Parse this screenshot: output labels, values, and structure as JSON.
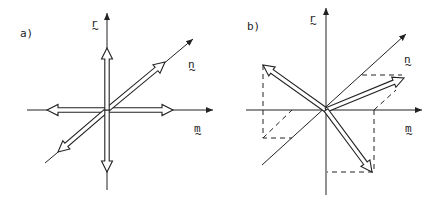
{
  "panels": [
    {
      "id": "a",
      "label": "a)",
      "axis_labels": {
        "r": "r",
        "n": "n",
        "m": "m"
      },
      "description": "Three double-headed vector pairs along r, n and m axes"
    },
    {
      "id": "b",
      "label": "b)",
      "axis_labels": {
        "r": "r",
        "n": "n",
        "m": "m"
      },
      "description": "Three double-headed vectors in general directions with dashed projection lines"
    }
  ],
  "tilde": "~",
  "colors": {
    "ink": "#222222",
    "background": "#ffffff"
  }
}
